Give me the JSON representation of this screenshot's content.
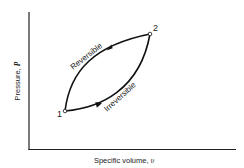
{
  "figure": {
    "type": "P-v diagram",
    "xlabel": "Specific volume, ",
    "xlabel_symbol": "υ",
    "ylabel": "Pressure, ",
    "ylabel_symbol": "P",
    "points": [
      {
        "label": "1"
      },
      {
        "label": "2"
      }
    ],
    "paths": [
      {
        "label": "Reversible",
        "direction": "2 to 1"
      },
      {
        "label": "Irreversible",
        "direction": "1 to 2"
      }
    ]
  }
}
